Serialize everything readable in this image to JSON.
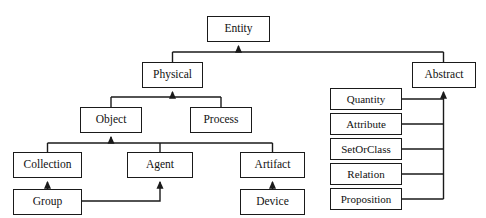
{
  "diagram": {
    "type": "class-hierarchy-tree",
    "style": {
      "background_color": "#ffffff",
      "box_fill_color": "#ffffff",
      "box_border_color": "#1a1a1a",
      "text_color": "#111111",
      "connector_color": "#1a1a1a",
      "arrow_style": "solid-triangle-pointing-to-parent"
    },
    "nodes": [
      {
        "id": "entity",
        "label": "Entity",
        "x": 207,
        "y": 16,
        "w": 63,
        "h": 26,
        "font_size": 11.5,
        "level": 0
      },
      {
        "id": "physical",
        "label": "Physical",
        "x": 142,
        "y": 62,
        "w": 61,
        "h": 26,
        "font_size": 11.5,
        "level": 1
      },
      {
        "id": "abstract",
        "label": "Abstract",
        "x": 412,
        "y": 62,
        "w": 64,
        "h": 26,
        "font_size": 11.5,
        "level": 1
      },
      {
        "id": "object",
        "label": "Object",
        "x": 80,
        "y": 107,
        "w": 62,
        "h": 26,
        "font_size": 11.5,
        "level": 2
      },
      {
        "id": "process",
        "label": "Process",
        "x": 190,
        "y": 107,
        "w": 62,
        "h": 26,
        "font_size": 11.5,
        "level": 2
      },
      {
        "id": "collection",
        "label": "Collection",
        "x": 13,
        "y": 152,
        "w": 69,
        "h": 26,
        "font_size": 11.5,
        "level": 3
      },
      {
        "id": "agent",
        "label": "Agent",
        "x": 127,
        "y": 152,
        "w": 66,
        "h": 26,
        "font_size": 11.5,
        "level": 3
      },
      {
        "id": "artifact",
        "label": "Artifact",
        "x": 240,
        "y": 152,
        "w": 65,
        "h": 26,
        "font_size": 11.5,
        "level": 3
      },
      {
        "id": "group",
        "label": "Group",
        "x": 13,
        "y": 189,
        "w": 69,
        "h": 26,
        "font_size": 11.5,
        "level": 4
      },
      {
        "id": "device",
        "label": "Device",
        "x": 240,
        "y": 189,
        "w": 65,
        "h": 26,
        "font_size": 11.5,
        "level": 4
      },
      {
        "id": "quantity",
        "label": "Quantity",
        "x": 330,
        "y": 88,
        "w": 72,
        "h": 22,
        "font_size": 11,
        "level": 2
      },
      {
        "id": "attribute",
        "label": "Attribute",
        "x": 330,
        "y": 113,
        "w": 72,
        "h": 22,
        "font_size": 11,
        "level": 2
      },
      {
        "id": "setorclass",
        "label": "SetOrClass",
        "x": 330,
        "y": 138,
        "w": 72,
        "h": 22,
        "font_size": 11,
        "level": 2
      },
      {
        "id": "relation",
        "label": "Relation",
        "x": 330,
        "y": 163,
        "w": 72,
        "h": 22,
        "font_size": 11,
        "level": 2
      },
      {
        "id": "proposition",
        "label": "Proposition",
        "x": 330,
        "y": 188,
        "w": 72,
        "h": 22,
        "font_size": 11,
        "level": 2
      }
    ],
    "edges": [
      {
        "from": "physical",
        "to": "entity"
      },
      {
        "from": "abstract",
        "to": "entity"
      },
      {
        "from": "object",
        "to": "physical"
      },
      {
        "from": "process",
        "to": "physical"
      },
      {
        "from": "collection",
        "to": "object"
      },
      {
        "from": "agent",
        "to": "object"
      },
      {
        "from": "artifact",
        "to": "object"
      },
      {
        "from": "group",
        "to": "collection"
      },
      {
        "from": "group",
        "to": "agent"
      },
      {
        "from": "device",
        "to": "artifact"
      },
      {
        "from": "quantity",
        "to": "abstract"
      },
      {
        "from": "attribute",
        "to": "abstract"
      },
      {
        "from": "setorclass",
        "to": "abstract"
      },
      {
        "from": "relation",
        "to": "abstract"
      },
      {
        "from": "proposition",
        "to": "abstract"
      }
    ]
  }
}
